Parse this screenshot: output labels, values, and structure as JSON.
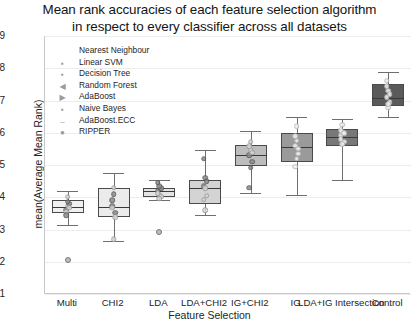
{
  "chart_data": {
    "type": "box",
    "title": "Mean rank accuracies of each feature selection algorithm in respect to every classifier across all datasets",
    "title_line1": "Mean rank accuracies of each feature selection algorithm",
    "title_line2": "in respect to every classifier across all datasets",
    "xlabel": "Feature Selection",
    "ylabel": "mean(Average Mean Rank)",
    "ylim": [
      1,
      9
    ],
    "yticks": [
      1,
      2,
      3,
      4,
      5,
      6,
      7,
      8,
      9
    ],
    "grid": true,
    "legend_title": "",
    "legend_position": "upper-left-inside",
    "legend": [
      {
        "label": "Nearest Neighbour",
        "marker": "square"
      },
      {
        "label": "Linear SVM",
        "marker": "square-small"
      },
      {
        "label": "Decision Tree",
        "marker": "square-small"
      },
      {
        "label": "Random Forest",
        "marker": "triangle-left"
      },
      {
        "label": "AdaBoost",
        "marker": "triangle-right"
      },
      {
        "label": "Naive Bayes",
        "marker": "square-small"
      },
      {
        "label": "AdaBoost.ECC",
        "marker": "dash"
      },
      {
        "label": "RIPPER",
        "marker": "circle"
      }
    ],
    "categories": [
      "Multi",
      "CHI2",
      "LDA",
      "LDA+CHI2",
      "IG+CHI2",
      "IG",
      "LDA+IG Intersection",
      "Control"
    ],
    "boxes": [
      {
        "category": "Multi",
        "whisker_low": 3.15,
        "q1": 3.5,
        "median": 3.7,
        "q3": 3.92,
        "whisker_high": 4.18,
        "fliers": [
          2.05
        ],
        "fill": "#f0f0f0",
        "points": [
          3.62,
          3.74,
          3.8,
          3.55,
          3.86,
          3.68,
          3.45,
          4.02
        ]
      },
      {
        "category": "CHI2",
        "whisker_low": 2.65,
        "q1": 3.4,
        "median": 3.7,
        "q3": 4.28,
        "whisker_high": 4.75,
        "fliers": [],
        "fill": "#ebebeb",
        "points": [
          3.72,
          4.3,
          3.52,
          3.68,
          4.1,
          3.38,
          3.9,
          2.7
        ]
      },
      {
        "category": "LDA",
        "whisker_low": 3.9,
        "q1": 4.0,
        "median": 4.18,
        "q3": 4.3,
        "whisker_high": 4.52,
        "fliers": [
          2.92
        ],
        "fill": "#e3e3e3",
        "points": [
          4.2,
          4.08,
          4.28,
          4.12,
          4.34,
          4.02,
          4.45,
          3.95
        ]
      },
      {
        "category": "LDA+CHI2",
        "whisker_low": 3.45,
        "q1": 3.78,
        "median": 4.3,
        "q3": 4.52,
        "whisker_high": 5.48,
        "fliers": [],
        "fill": "#d4d4d4",
        "points": [
          4.35,
          4.28,
          4.5,
          3.92,
          4.6,
          4.05,
          5.2,
          3.6
        ]
      },
      {
        "category": "IG+CHI2",
        "whisker_low": 4.12,
        "q1": 4.98,
        "median": 5.32,
        "q3": 5.62,
        "whisker_high": 6.05,
        "fliers": [],
        "fill": "#bdbdbd",
        "points": [
          5.3,
          5.45,
          5.1,
          5.58,
          4.92,
          5.38,
          4.3,
          5.72
        ]
      },
      {
        "category": "IG",
        "whisker_low": 4.08,
        "q1": 5.1,
        "median": 5.55,
        "q3": 5.98,
        "whisker_high": 6.48,
        "fliers": [],
        "fill": "#9a9a9a",
        "points": [
          5.6,
          5.75,
          5.35,
          5.9,
          5.2,
          5.5,
          4.95,
          6.2
        ]
      },
      {
        "category": "LDA+IG Intersection",
        "whisker_low": 4.55,
        "q1": 5.6,
        "median": 5.88,
        "q3": 6.12,
        "whisker_high": 6.42,
        "fliers": [],
        "fill": "#787878",
        "points": [
          5.92,
          6.02,
          5.72,
          6.08,
          5.65,
          5.98,
          5.8,
          6.25
        ]
      },
      {
        "category": "Control",
        "whisker_low": 6.48,
        "q1": 6.82,
        "median": 7.08,
        "q3": 7.52,
        "whisker_high": 7.88,
        "fliers": [],
        "fill": "#5a5a5a",
        "points": [
          7.1,
          7.3,
          6.95,
          7.45,
          6.78,
          7.2,
          7.62,
          6.88
        ]
      }
    ]
  }
}
